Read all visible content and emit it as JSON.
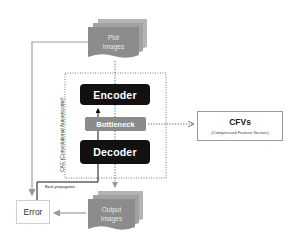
{
  "diagram": {
    "input": {
      "label_line1": "Plot",
      "label_line2": "Images"
    },
    "output": {
      "label_line1": "Output",
      "label_line2": "Images"
    },
    "cae": {
      "label": "CAE (Convolutional Autoencoder)",
      "encoder": "Encoder",
      "bottleneck": "Bottleneck",
      "decoder": "Decoder"
    },
    "cfv": {
      "title": "CFVs",
      "subtitle": "(Compressed Feature Vectors)"
    },
    "error": "Error",
    "backprop": "Back-propagation",
    "colors": {
      "block": "#111111",
      "bottleneck": "#8a8a8a",
      "stack": "#8c8c8c",
      "line": "#9a9a9a"
    }
  }
}
